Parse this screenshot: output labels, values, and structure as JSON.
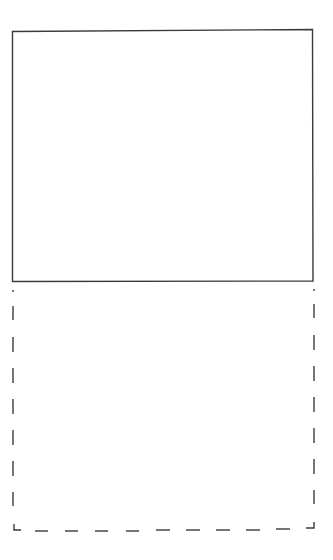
{
  "diagram": {
    "stroke_color": "#3a3a3a",
    "background": "#ffffff",
    "shapes": [
      {
        "id": "solid-box",
        "style": "solid",
        "x": 12,
        "y": 30,
        "width": 301,
        "height": 251
      },
      {
        "id": "dashed-box",
        "style": "dashed",
        "x": 13,
        "y": 281,
        "width": 301,
        "height": 248,
        "top_edge": "shared with solid box"
      }
    ]
  }
}
